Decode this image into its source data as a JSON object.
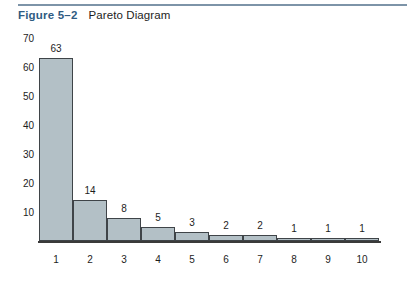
{
  "caption": {
    "figure_number": "Figure 5–2",
    "title": "Pareto Diagram",
    "figure_number_color": "#2f5b82",
    "title_color": "#1d1d1d",
    "rule_color": "#7d94a8"
  },
  "chart_data": {
    "type": "bar",
    "title": "Pareto Diagram",
    "xlabel": "",
    "ylabel": "",
    "categories": [
      "1",
      "2",
      "3",
      "4",
      "5",
      "6",
      "7",
      "8",
      "9",
      "10"
    ],
    "values": [
      63,
      14,
      8,
      5,
      3,
      2,
      2,
      1,
      1,
      1
    ],
    "data_labels": [
      "63",
      "14",
      "8",
      "5",
      "3",
      "2",
      "2",
      "1",
      "1",
      "1"
    ],
    "yticks": [
      10,
      20,
      30,
      40,
      50,
      60,
      70
    ],
    "ytick_labels": [
      "10",
      "20",
      "30",
      "40",
      "50",
      "60",
      "70"
    ],
    "ylim": [
      0,
      70
    ],
    "grid": false,
    "legend": false,
    "bar_gap": 0,
    "bar_fill_color": "#b3c0c6",
    "bar_edge_color": "#3f4448",
    "axis_color": "#3a3a3a",
    "y_axis_line_visible": false,
    "background_color": "#ffffff"
  }
}
